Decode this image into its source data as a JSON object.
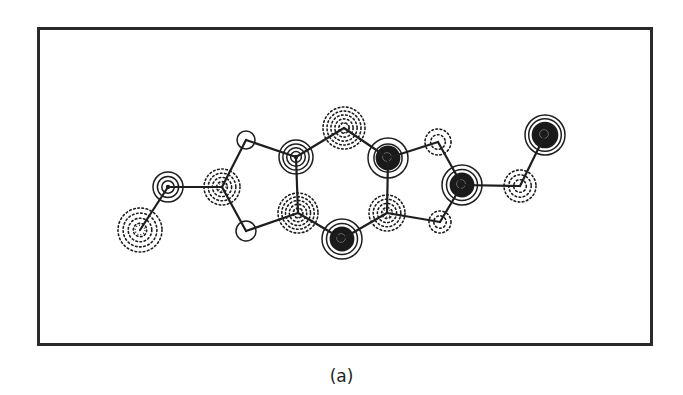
{
  "figure": {
    "caption": "(a)",
    "colors": {
      "ink": "#1e1e1e",
      "background": "#ffffff",
      "frame": "#2a2a2a"
    }
  },
  "atoms": [
    {
      "id": "a0",
      "x": 140,
      "y": 230,
      "r": 22,
      "type": "dotted",
      "rings": 0,
      "dense": 3
    },
    {
      "id": "a1",
      "x": 168,
      "y": 187,
      "r": 15,
      "type": "solid",
      "rings": 3,
      "dark": false
    },
    {
      "id": "a2",
      "x": 222,
      "y": 187,
      "r": 18,
      "type": "dotted",
      "rings": 0,
      "dense": 3
    },
    {
      "id": "a3",
      "x": 246,
      "y": 140,
      "r": 9,
      "type": "solid",
      "rings": 1,
      "dark": false
    },
    {
      "id": "a4",
      "x": 246,
      "y": 231,
      "r": 10,
      "type": "solid",
      "rings": 1,
      "dark": false
    },
    {
      "id": "a5",
      "x": 296,
      "y": 157,
      "r": 17,
      "type": "solid",
      "rings": 4,
      "dark": false
    },
    {
      "id": "a6",
      "x": 298,
      "y": 213,
      "r": 20,
      "type": "dotted",
      "rings": 0,
      "dense": 4
    },
    {
      "id": "a7",
      "x": 344,
      "y": 128,
      "r": 21,
      "type": "dotted",
      "rings": 0,
      "dense": 4
    },
    {
      "id": "a8",
      "x": 388,
      "y": 158,
      "r": 20,
      "type": "solid",
      "rings": 3,
      "dark": true
    },
    {
      "id": "a9",
      "x": 342,
      "y": 239,
      "r": 20,
      "type": "solid",
      "rings": 4,
      "dark": true
    },
    {
      "id": "a10",
      "x": 387,
      "y": 213,
      "r": 18,
      "type": "dotted",
      "rings": 0,
      "dense": 3
    },
    {
      "id": "a11",
      "x": 438,
      "y": 142,
      "r": 13,
      "type": "dotted",
      "rings": 0,
      "dense": 1
    },
    {
      "id": "a12",
      "x": 440,
      "y": 222,
      "r": 11,
      "type": "dotted",
      "rings": 0,
      "dense": 1
    },
    {
      "id": "a13",
      "x": 462,
      "y": 185,
      "r": 20,
      "type": "solid",
      "rings": 4,
      "dark": true
    },
    {
      "id": "a14",
      "x": 520,
      "y": 186,
      "r": 16,
      "type": "dotted",
      "rings": 0,
      "dense": 2
    },
    {
      "id": "a15",
      "x": 545,
      "y": 135,
      "r": 20,
      "type": "solid",
      "rings": 5,
      "dark": true
    }
  ],
  "bonds": [
    [
      "a1",
      "a0"
    ],
    [
      "a1",
      "a2"
    ],
    [
      "a2",
      "a3"
    ],
    [
      "a2",
      "a4"
    ],
    [
      "a3",
      "a5"
    ],
    [
      "a4",
      "a6"
    ],
    [
      "a5",
      "a6"
    ],
    [
      "a5",
      "a7"
    ],
    [
      "a7",
      "a8"
    ],
    [
      "a6",
      "a9"
    ],
    [
      "a9",
      "a10"
    ],
    [
      "a10",
      "a8"
    ],
    [
      "a8",
      "a11"
    ],
    [
      "a10",
      "a12"
    ],
    [
      "a11",
      "a13"
    ],
    [
      "a12",
      "a13"
    ],
    [
      "a13",
      "a14"
    ],
    [
      "a14",
      "a15"
    ]
  ]
}
